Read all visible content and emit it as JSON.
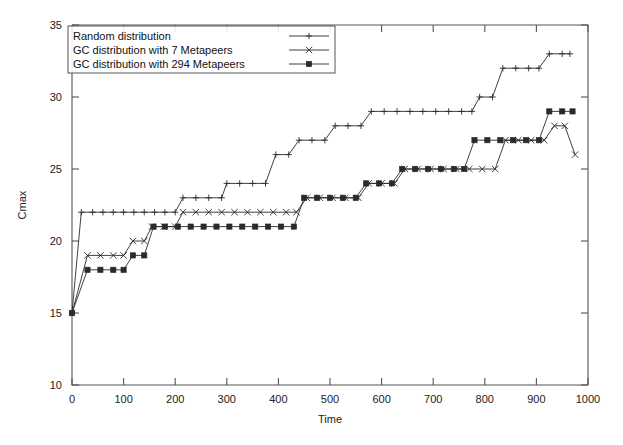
{
  "chart_data": {
    "type": "line",
    "title": "",
    "xlabel": "Time",
    "ylabel": "Cmax",
    "xlim": [
      0,
      1000
    ],
    "ylim": [
      10,
      35
    ],
    "xticks": [
      0,
      100,
      200,
      300,
      400,
      500,
      600,
      700,
      800,
      900,
      1000
    ],
    "yticks": [
      10,
      15,
      20,
      25,
      30,
      35
    ],
    "grid": false,
    "legend_position": "top-left",
    "series": [
      {
        "name": "Random distribution",
        "marker": "plus",
        "points": [
          [
            0,
            15
          ],
          [
            18,
            22
          ],
          [
            40,
            22
          ],
          [
            60,
            22
          ],
          [
            80,
            22
          ],
          [
            100,
            22
          ],
          [
            120,
            22
          ],
          [
            140,
            22
          ],
          [
            160,
            22
          ],
          [
            180,
            22
          ],
          [
            200,
            22
          ],
          [
            215,
            23
          ],
          [
            240,
            23
          ],
          [
            265,
            23
          ],
          [
            290,
            23
          ],
          [
            300,
            24
          ],
          [
            325,
            24
          ],
          [
            350,
            24
          ],
          [
            375,
            24
          ],
          [
            395,
            26
          ],
          [
            420,
            26
          ],
          [
            440,
            27
          ],
          [
            465,
            27
          ],
          [
            490,
            27
          ],
          [
            510,
            28
          ],
          [
            535,
            28
          ],
          [
            560,
            28
          ],
          [
            580,
            29
          ],
          [
            605,
            29
          ],
          [
            630,
            29
          ],
          [
            655,
            29
          ],
          [
            680,
            29
          ],
          [
            705,
            29
          ],
          [
            730,
            29
          ],
          [
            755,
            29
          ],
          [
            775,
            29
          ],
          [
            790,
            30
          ],
          [
            815,
            30
          ],
          [
            835,
            32
          ],
          [
            860,
            32
          ],
          [
            885,
            32
          ],
          [
            905,
            32
          ],
          [
            925,
            33
          ],
          [
            950,
            33
          ],
          [
            965,
            33
          ]
        ]
      },
      {
        "name": "GC distribution with 7 Metapeers",
        "marker": "cross",
        "points": [
          [
            0,
            15
          ],
          [
            30,
            19
          ],
          [
            55,
            19
          ],
          [
            80,
            19
          ],
          [
            100,
            19
          ],
          [
            118,
            20
          ],
          [
            140,
            20
          ],
          [
            155,
            21
          ],
          [
            178,
            21
          ],
          [
            200,
            21
          ],
          [
            215,
            22
          ],
          [
            240,
            22
          ],
          [
            265,
            22
          ],
          [
            290,
            22
          ],
          [
            315,
            22
          ],
          [
            340,
            22
          ],
          [
            365,
            22
          ],
          [
            390,
            22
          ],
          [
            415,
            22
          ],
          [
            435,
            22
          ],
          [
            455,
            23
          ],
          [
            480,
            23
          ],
          [
            505,
            23
          ],
          [
            530,
            23
          ],
          [
            555,
            23
          ],
          [
            575,
            24
          ],
          [
            600,
            24
          ],
          [
            625,
            24
          ],
          [
            645,
            25
          ],
          [
            670,
            25
          ],
          [
            695,
            25
          ],
          [
            720,
            25
          ],
          [
            745,
            25
          ],
          [
            770,
            25
          ],
          [
            795,
            25
          ],
          [
            820,
            25
          ],
          [
            840,
            27
          ],
          [
            865,
            27
          ],
          [
            890,
            27
          ],
          [
            915,
            27
          ],
          [
            935,
            28
          ],
          [
            955,
            28
          ],
          [
            975,
            26
          ]
        ]
      },
      {
        "name": "GC distribution with 294 Metapeers",
        "marker": "square",
        "points": [
          [
            0,
            15
          ],
          [
            30,
            18
          ],
          [
            55,
            18
          ],
          [
            80,
            18
          ],
          [
            100,
            18
          ],
          [
            118,
            19
          ],
          [
            140,
            19
          ],
          [
            158,
            21
          ],
          [
            180,
            21
          ],
          [
            205,
            21
          ],
          [
            230,
            21
          ],
          [
            255,
            21
          ],
          [
            280,
            21
          ],
          [
            305,
            21
          ],
          [
            330,
            21
          ],
          [
            355,
            21
          ],
          [
            380,
            21
          ],
          [
            405,
            21
          ],
          [
            430,
            21
          ],
          [
            450,
            23
          ],
          [
            475,
            23
          ],
          [
            500,
            23
          ],
          [
            525,
            23
          ],
          [
            550,
            23
          ],
          [
            570,
            24
          ],
          [
            595,
            24
          ],
          [
            620,
            24
          ],
          [
            640,
            25
          ],
          [
            665,
            25
          ],
          [
            690,
            25
          ],
          [
            715,
            25
          ],
          [
            740,
            25
          ],
          [
            760,
            25
          ],
          [
            780,
            27
          ],
          [
            805,
            27
          ],
          [
            830,
            27
          ],
          [
            855,
            27
          ],
          [
            880,
            27
          ],
          [
            905,
            27
          ],
          [
            925,
            29
          ],
          [
            950,
            29
          ],
          [
            970,
            29
          ]
        ]
      }
    ]
  }
}
